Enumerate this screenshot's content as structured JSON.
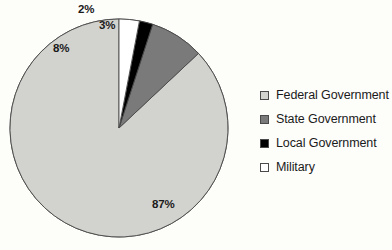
{
  "chart_data": {
    "type": "pie",
    "title": "",
    "categories": [
      "Federal Government",
      "State Government",
      "Local Government",
      "Military"
    ],
    "values": [
      87,
      8,
      2,
      3
    ],
    "value_labels": [
      "87%",
      "8%",
      "2%",
      "3%"
    ],
    "colors": [
      "#d2d2ce",
      "#7a7a7a",
      "#000000",
      "#ffffff"
    ],
    "slice_border_color": "#4a4a4a",
    "legend_position": "right",
    "start_angle_deg": 90,
    "direction": "counterclockwise",
    "units": "percent",
    "grid": false,
    "xlabel": "",
    "ylabel": ""
  },
  "legend": {
    "items": [
      {
        "label": "Federal Government",
        "color": "#d2d2ce",
        "swatch_name": "legend-swatch-federal-government"
      },
      {
        "label": "State Government",
        "color": "#7a7a7a",
        "swatch_name": "legend-swatch-state-government"
      },
      {
        "label": "Local Government",
        "color": "#000000",
        "swatch_name": "legend-swatch-local-government"
      },
      {
        "label": "Military",
        "color": "#ffffff",
        "swatch_name": "legend-swatch-military"
      }
    ]
  },
  "canvas": {
    "background": "#fdfdfa",
    "pie_center_x": 119,
    "pie_center_y": 128,
    "pie_radius": 109
  }
}
